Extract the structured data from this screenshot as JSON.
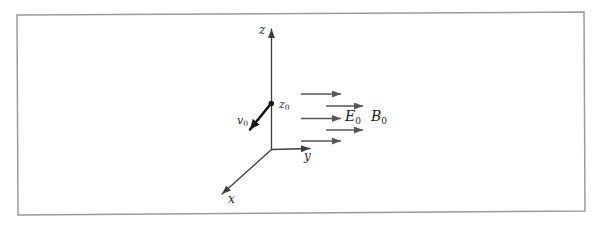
{
  "figure": {
    "labels": {
      "z_axis": "z",
      "y_axis": "y",
      "x_axis": "x",
      "z0": {
        "base": "z",
        "sub": "0"
      },
      "v0": {
        "base": "v",
        "sub": "0"
      },
      "E0": {
        "base": "E",
        "sub": "0"
      },
      "B0": {
        "base": "B",
        "sub": "0"
      }
    },
    "colors": {
      "frame": "#9b9b9b",
      "axis": "#3d3d3d",
      "field_arrow": "#575757",
      "vector": "#161616",
      "background": "#ffffff"
    }
  }
}
